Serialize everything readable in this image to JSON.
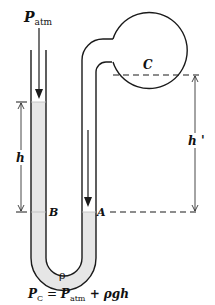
{
  "diagram": {
    "labels": {
      "p_atm_main": "P",
      "p_atm_sub": "atm",
      "bulb": "C",
      "height_left": "h",
      "height_right": "h '",
      "point_b": "B",
      "point_a": "A",
      "density": "ρ"
    },
    "formula": {
      "lhs_main": "P",
      "lhs_sub": "C",
      "eq": " = ",
      "rhs1_main": "P",
      "rhs1_sub": "atm",
      "rhs2": " + ρg",
      "rhs3": "h"
    },
    "colors": {
      "stroke": "#1a1a1a",
      "liquid": "#e6e6e6",
      "background": "#ffffff"
    }
  }
}
